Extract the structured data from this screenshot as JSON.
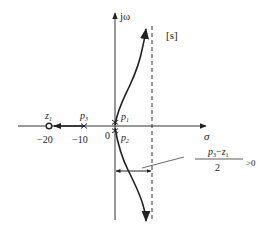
{
  "diagram": {
    "type": "root-locus",
    "plane_label": "[s]",
    "axes": {
      "imag_label": "jω",
      "real_label": "σ",
      "origin_label": "0"
    },
    "zeros": [
      {
        "name": "z",
        "sub": "1",
        "value_label": "−20"
      }
    ],
    "poles": [
      {
        "name": "p",
        "sub": "3",
        "value_label": "−10"
      },
      {
        "name": "p",
        "sub": "1"
      },
      {
        "name": "p",
        "sub": "2"
      }
    ],
    "asymptote_annotation": {
      "numerator_p": "p",
      "numerator_p_sub": "3",
      "numerator_op": "−",
      "numerator_z": "z",
      "numerator_z_sub": "1",
      "denominator": "2",
      "condition": ">0"
    },
    "colors": {
      "line": "#222222",
      "background": "#ffffff"
    }
  }
}
